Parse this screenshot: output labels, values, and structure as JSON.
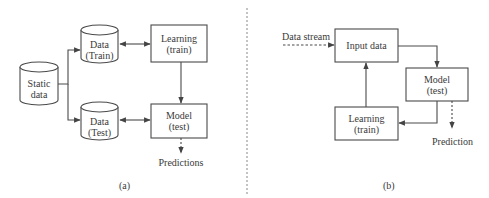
{
  "panel_a": {
    "caption": "(a)",
    "nodes": {
      "static_data": {
        "line1": "Static",
        "line2": "data",
        "shape": "cylinder"
      },
      "data_train": {
        "line1": "Data",
        "line2": "(Train)",
        "shape": "cylinder"
      },
      "data_test": {
        "line1": "Data",
        "line2": "(Test)",
        "shape": "cylinder"
      },
      "learning": {
        "line1": "Learning",
        "line2": "(train)",
        "shape": "box"
      },
      "model": {
        "line1": "Model",
        "line2": "(test)",
        "shape": "box"
      },
      "predictions": {
        "label": "Predictions"
      }
    },
    "edges": [
      {
        "from": "static_data",
        "to": "data_train",
        "style": "solid"
      },
      {
        "from": "static_data",
        "to": "data_test",
        "style": "solid"
      },
      {
        "from": "data_train",
        "to": "learning",
        "style": "solid",
        "bidirectional": true
      },
      {
        "from": "data_test",
        "to": "model",
        "style": "solid",
        "bidirectional": true
      },
      {
        "from": "learning",
        "to": "model",
        "style": "solid"
      },
      {
        "from": "model",
        "to": "predictions",
        "style": "dashed"
      }
    ]
  },
  "panel_b": {
    "caption": "(b)",
    "nodes": {
      "data_stream": {
        "label": "Data stream"
      },
      "input_data": {
        "line1": "Input data",
        "shape": "box"
      },
      "model": {
        "line1": "Model",
        "line2": "(test)",
        "shape": "box"
      },
      "learning": {
        "line1": "Learning",
        "line2": "(train)",
        "shape": "box"
      },
      "prediction": {
        "label": "Prediction"
      }
    },
    "edges": [
      {
        "from": "data_stream",
        "to": "input_data",
        "style": "dashed"
      },
      {
        "from": "input_data",
        "to": "model",
        "style": "solid"
      },
      {
        "from": "model",
        "to": "learning",
        "style": "solid"
      },
      {
        "from": "learning",
        "to": "input_data",
        "style": "solid"
      },
      {
        "from": "model",
        "to": "prediction",
        "style": "dashed"
      }
    ]
  },
  "colors": {
    "stroke": "#4a4a4a",
    "text": "#3a3a3a",
    "divider": "#888888"
  }
}
